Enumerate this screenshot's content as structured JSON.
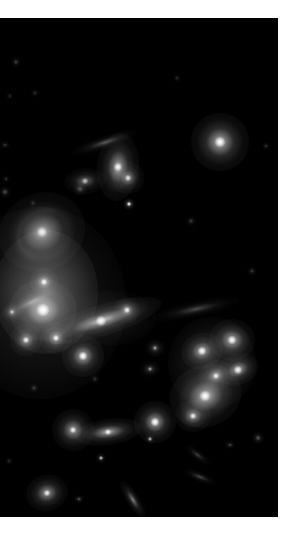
{
  "page": {
    "background_color": "#ffffff",
    "width": 289,
    "height": 538
  },
  "image": {
    "name": "galaxy-cluster-photograph",
    "alt_text": "Deep-sky astronomical image of a galaxy cluster on black sky",
    "sky_color": "#000000",
    "frame": {
      "x": 0,
      "y": 18,
      "width": 278,
      "height": 499
    }
  },
  "chart_data": {
    "type": "scatter",
    "xlabel": "",
    "ylabel": "",
    "xlim": [
      0,
      278
    ],
    "ylim": [
      0,
      499
    ],
    "grid": false,
    "legend": "none",
    "background": "#000000",
    "point_color": "#ffffff",
    "intracluster_light": [
      {
        "name": "cluster-core-halo",
        "cx": 46,
        "cy": 274,
        "rx": 52,
        "ry": 62,
        "peak": 0.3
      },
      {
        "name": "cluster-outer-halo",
        "cx": 40,
        "cy": 285,
        "rx": 86,
        "ry": 96,
        "peak": 0.13
      },
      {
        "name": "east-group-halo",
        "cx": 212,
        "cy": 345,
        "rx": 44,
        "ry": 46,
        "peak": 0.14
      },
      {
        "name": "mid-bridge-glow",
        "cx": 110,
        "cy": 300,
        "rx": 46,
        "ry": 28,
        "peak": 0.09
      }
    ],
    "objects": [
      {
        "name": "spiral-galaxy-ngc-upper-left",
        "type": "spiral",
        "cx": 42,
        "cy": 214,
        "rx": 17,
        "ry": 15,
        "angle": -25,
        "brightness": 0.82,
        "core": 5
      },
      {
        "name": "elliptical-cd-galaxy-core",
        "type": "elliptical",
        "cx": 43,
        "cy": 292,
        "rx": 13,
        "ry": 12,
        "angle": 0,
        "brightness": 1.0,
        "core": 6
      },
      {
        "name": "edge-on-galaxy-center",
        "type": "edge-on",
        "cx": 101,
        "cy": 303,
        "rx": 24,
        "ry": 6,
        "angle": -17,
        "brightness": 0.92,
        "core": 5
      },
      {
        "name": "bright-galaxy-upper-right",
        "type": "elliptical",
        "cx": 220,
        "cy": 124,
        "rx": 11,
        "ry": 11,
        "angle": 0,
        "brightness": 0.95,
        "core": 5
      },
      {
        "name": "lenticular-galaxy-upper-mid",
        "type": "lenticular",
        "cx": 118,
        "cy": 149,
        "rx": 8,
        "ry": 13,
        "angle": 5,
        "brightness": 0.88,
        "core": 4
      },
      {
        "name": "thin-streak-galaxy-upper",
        "type": "edge-on",
        "cx": 105,
        "cy": 124,
        "rx": 13,
        "ry": 2.5,
        "angle": -18,
        "brightness": 0.42,
        "core": 0
      },
      {
        "name": "galaxy-left-of-lenticular",
        "type": "elliptical",
        "cx": 85,
        "cy": 163,
        "rx": 8,
        "ry": 5,
        "angle": -5,
        "brightness": 0.55,
        "core": 3
      },
      {
        "name": "galaxy-below-lenticular",
        "type": "elliptical",
        "cx": 128,
        "cy": 160,
        "rx": 6,
        "ry": 6,
        "angle": 0,
        "brightness": 0.7,
        "core": 3
      },
      {
        "name": "point-source-mid-upper",
        "type": "point",
        "cx": 129,
        "cy": 186,
        "rx": 2.2,
        "ry": 2.2,
        "angle": 0,
        "brightness": 0.8,
        "core": 2
      },
      {
        "name": "galaxy-above-core-left",
        "type": "elliptical",
        "cx": 44,
        "cy": 264,
        "rx": 5.5,
        "ry": 5.5,
        "angle": 0,
        "brightness": 0.88,
        "core": 3
      },
      {
        "name": "galaxy-left-core-faint",
        "type": "elliptical",
        "cx": 12,
        "cy": 294,
        "rx": 4,
        "ry": 4,
        "angle": 0,
        "brightness": 0.58,
        "core": 2
      },
      {
        "name": "arc-galaxy-left-core",
        "type": "edge-on",
        "cx": 32,
        "cy": 284,
        "rx": 13,
        "ry": 3,
        "angle": -25,
        "brightness": 0.48,
        "core": 0
      },
      {
        "name": "galaxy-below-core-left",
        "type": "elliptical",
        "cx": 26,
        "cy": 322,
        "rx": 6,
        "ry": 6,
        "angle": 0,
        "brightness": 0.8,
        "core": 3
      },
      {
        "name": "galaxy-below-core-right",
        "type": "elliptical",
        "cx": 56,
        "cy": 320,
        "rx": 6,
        "ry": 6,
        "angle": 0,
        "brightness": 0.82,
        "core": 3
      },
      {
        "name": "bright-galaxy-lower-center-left",
        "type": "elliptical",
        "cx": 83,
        "cy": 338,
        "rx": 8,
        "ry": 8,
        "angle": 0,
        "brightness": 0.92,
        "core": 4
      },
      {
        "name": "galaxy-right-of-edge-on",
        "type": "elliptical",
        "cx": 127,
        "cy": 292,
        "rx": 5,
        "ry": 5,
        "angle": 0,
        "brightness": 0.8,
        "core": 3
      },
      {
        "name": "galaxy-east-group-top",
        "type": "elliptical",
        "cx": 232,
        "cy": 322,
        "rx": 9,
        "ry": 8,
        "angle": 0,
        "brightness": 0.9,
        "core": 4
      },
      {
        "name": "galaxy-east-group-left",
        "type": "elliptical",
        "cx": 202,
        "cy": 333,
        "rx": 8,
        "ry": 7,
        "angle": -20,
        "brightness": 0.88,
        "core": 4
      },
      {
        "name": "galaxy-east-group-right",
        "type": "elliptical",
        "cx": 238,
        "cy": 352,
        "rx": 8,
        "ry": 6,
        "angle": -20,
        "brightness": 0.85,
        "core": 4
      },
      {
        "name": "galaxy-east-group-center",
        "type": "elliptical",
        "cx": 216,
        "cy": 358,
        "rx": 7,
        "ry": 6,
        "angle": -25,
        "brightness": 0.8,
        "core": 3
      },
      {
        "name": "elliptical-galaxy-east-main",
        "type": "elliptical",
        "cx": 205,
        "cy": 378,
        "rx": 14,
        "ry": 12,
        "angle": -20,
        "brightness": 0.95,
        "core": 5
      },
      {
        "name": "galaxy-east-lower",
        "type": "elliptical",
        "cx": 193,
        "cy": 398,
        "rx": 7,
        "ry": 6,
        "angle": 0,
        "brightness": 0.78,
        "core": 3
      },
      {
        "name": "faint-galaxy-east-far-left",
        "type": "elliptical",
        "cx": 155,
        "cy": 330,
        "rx": 4,
        "ry": 3.5,
        "angle": 0,
        "brightness": 0.45,
        "core": 2
      },
      {
        "name": "faint-galaxy-east-edge",
        "type": "elliptical",
        "cx": 150,
        "cy": 351,
        "rx": 4,
        "ry": 3,
        "angle": 0,
        "brightness": 0.42,
        "core": 2
      },
      {
        "name": "arc-streak-east-upper",
        "type": "edge-on",
        "cx": 196,
        "cy": 291,
        "rx": 17,
        "ry": 3,
        "angle": -12,
        "brightness": 0.35,
        "core": 0
      },
      {
        "name": "galaxy-lower-left-round",
        "type": "elliptical",
        "cx": 73,
        "cy": 412,
        "rx": 8,
        "ry": 8,
        "angle": 0,
        "brightness": 0.82,
        "core": 3
      },
      {
        "name": "galaxy-lower-center-edge-on",
        "type": "edge-on",
        "cx": 108,
        "cy": 414,
        "rx": 13,
        "ry": 5,
        "angle": -8,
        "brightness": 0.85,
        "core": 3
      },
      {
        "name": "galaxy-lower-right-bright",
        "type": "elliptical",
        "cx": 155,
        "cy": 404,
        "rx": 8,
        "ry": 8,
        "angle": 0,
        "brightness": 0.92,
        "core": 4
      },
      {
        "name": "point-lower-center",
        "type": "point",
        "cx": 101,
        "cy": 440,
        "rx": 2,
        "ry": 2,
        "angle": 0,
        "brightness": 0.55,
        "core": 2
      },
      {
        "name": "point-below-lower-right",
        "type": "point",
        "cx": 150,
        "cy": 421,
        "rx": 2,
        "ry": 2,
        "angle": 0,
        "brightness": 0.5,
        "core": 2
      },
      {
        "name": "galaxy-bottom-left",
        "type": "elliptical",
        "cx": 47,
        "cy": 475,
        "rx": 8,
        "ry": 7,
        "angle": -15,
        "brightness": 0.8,
        "core": 3
      },
      {
        "name": "streak-bottom-center",
        "type": "edge-on",
        "cx": 133,
        "cy": 481,
        "rx": 8,
        "ry": 2.5,
        "angle": 58,
        "brightness": 0.6,
        "core": 0
      },
      {
        "name": "point-bottom-center-left",
        "type": "point",
        "cx": 79,
        "cy": 481,
        "rx": 2,
        "ry": 1.6,
        "angle": 0,
        "brightness": 0.45,
        "core": 0
      },
      {
        "name": "point-bottom-right",
        "type": "point",
        "cx": 139,
        "cy": 504,
        "rx": 2,
        "ry": 2,
        "angle": 0,
        "brightness": 0.55,
        "core": 2
      },
      {
        "name": "point-bottom-far-right",
        "type": "point",
        "cx": 139,
        "cy": 503,
        "rx": 1.8,
        "ry": 1.8,
        "angle": 0,
        "brightness": 0.5,
        "core": 0
      },
      {
        "name": "point-upper-left-faint-a",
        "type": "point",
        "cx": 16,
        "cy": 44,
        "rx": 1.8,
        "ry": 1.8,
        "angle": 0,
        "brightness": 0.35,
        "core": 0
      },
      {
        "name": "point-upper-left-faint-b",
        "type": "point",
        "cx": 35,
        "cy": 75,
        "rx": 1.6,
        "ry": 1.6,
        "angle": 0,
        "brightness": 0.28,
        "core": 0
      },
      {
        "name": "point-upper-left-faint-c",
        "type": "point",
        "cx": 10,
        "cy": 78,
        "rx": 1.4,
        "ry": 1.4,
        "angle": 0,
        "brightness": 0.22,
        "core": 0
      },
      {
        "name": "point-upper-right-faint",
        "type": "point",
        "cx": 177,
        "cy": 60,
        "rx": 1.6,
        "ry": 1.6,
        "angle": 0,
        "brightness": 0.24,
        "core": 0
      },
      {
        "name": "point-left-mid-faint",
        "type": "point",
        "cx": 5,
        "cy": 127,
        "rx": 2.0,
        "ry": 1.4,
        "angle": 0,
        "brightness": 0.3,
        "core": 0
      },
      {
        "name": "point-left-mid-faint-b",
        "type": "point",
        "cx": 6,
        "cy": 161,
        "rx": 1.6,
        "ry": 1.6,
        "angle": 0,
        "brightness": 0.28,
        "core": 0
      },
      {
        "name": "point-left-upper-galaxy",
        "type": "point",
        "cx": 5,
        "cy": 174,
        "rx": 2.2,
        "ry": 2.2,
        "angle": 0,
        "brightness": 0.4,
        "core": 0
      },
      {
        "name": "point-mid-left-small",
        "type": "point",
        "cx": 33,
        "cy": 185,
        "rx": 1.6,
        "ry": 1.6,
        "angle": 0,
        "brightness": 0.26,
        "core": 0
      },
      {
        "name": "point-near-spiral-upper",
        "type": "point",
        "cx": 80,
        "cy": 171,
        "rx": 2.6,
        "ry": 2.6,
        "angle": 0,
        "brightness": 0.42,
        "core": 0
      },
      {
        "name": "point-right-mid-faint",
        "type": "point",
        "cx": 266,
        "cy": 128,
        "rx": 1.6,
        "ry": 1.6,
        "angle": 0,
        "brightness": 0.3,
        "core": 0
      },
      {
        "name": "point-right-mid-faint-b",
        "type": "point",
        "cx": 191,
        "cy": 203,
        "rx": 1.8,
        "ry": 1.8,
        "angle": 0,
        "brightness": 0.32,
        "core": 0
      },
      {
        "name": "point-right-far",
        "type": "point",
        "cx": 252,
        "cy": 253,
        "rx": 1.8,
        "ry": 1.8,
        "angle": 0,
        "brightness": 0.3,
        "core": 0
      },
      {
        "name": "point-right-lower-a",
        "type": "point",
        "cx": 258,
        "cy": 420,
        "rx": 2.4,
        "ry": 2.4,
        "angle": 0,
        "brightness": 0.45,
        "core": 0
      },
      {
        "name": "streak-right-lower",
        "type": "edge-on",
        "cx": 200,
        "cy": 459,
        "rx": 7,
        "ry": 2,
        "angle": 22,
        "brightness": 0.35,
        "core": 0
      },
      {
        "name": "streak-right-mid",
        "type": "edge-on",
        "cx": 198,
        "cy": 437,
        "rx": 6,
        "ry": 2,
        "angle": 38,
        "brightness": 0.3,
        "core": 0
      },
      {
        "name": "point-right-upper-faint",
        "type": "point",
        "cx": 230,
        "cy": 427,
        "rx": 2.0,
        "ry": 1.5,
        "angle": 0,
        "brightness": 0.35,
        "core": 0
      },
      {
        "name": "point-center-lower-faint",
        "type": "point",
        "cx": 34,
        "cy": 370,
        "rx": 2.0,
        "ry": 2.0,
        "angle": 0,
        "brightness": 0.32,
        "core": 0
      },
      {
        "name": "point-center-lower-b",
        "type": "point",
        "cx": 95,
        "cy": 361,
        "rx": 1.8,
        "ry": 1.8,
        "angle": 0,
        "brightness": 0.28,
        "core": 0
      },
      {
        "name": "point-bottom-far-left",
        "type": "point",
        "cx": 9,
        "cy": 443,
        "rx": 1.6,
        "ry": 1.6,
        "angle": 0,
        "brightness": 0.25,
        "core": 0
      },
      {
        "name": "point-bottom-left-low",
        "type": "point",
        "cx": 20,
        "cy": 506,
        "rx": 1.6,
        "ry": 1.6,
        "angle": 0,
        "brightness": 0.24,
        "core": 0
      }
    ]
  }
}
